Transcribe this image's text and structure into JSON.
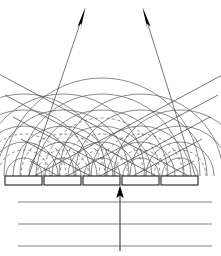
{
  "figure": {
    "title": "Phased array transducer beam steering with Huygens wavelets",
    "width": 221,
    "height": 256,
    "background_color": "#ffffff",
    "line_color": "#4a4a4a",
    "dark_line_color": "#1a1a1a",
    "arrow_color": "#000000"
  },
  "array": {
    "label": "transducer element array",
    "element_count": 5,
    "element_width": 37,
    "element_height": 9,
    "element_top_y": 176,
    "element_pitch": 39,
    "elements": [
      {
        "name": "element-1",
        "x": 5,
        "y": 176,
        "w": 37,
        "h": 9,
        "clipped": true
      },
      {
        "name": "element-2",
        "x": 44,
        "y": 176,
        "w": 37,
        "h": 9,
        "clipped": false
      },
      {
        "name": "element-3",
        "x": 83,
        "y": 176,
        "w": 37,
        "h": 9,
        "clipped": false
      },
      {
        "name": "element-4",
        "x": 122,
        "y": 176,
        "w": 37,
        "h": 9,
        "clipped": false
      },
      {
        "name": "element-5",
        "x": 161,
        "y": 176,
        "w": 37,
        "h": 9,
        "clipped": true
      }
    ]
  },
  "wavelets": {
    "label": "Huygens circular wavelets emitted by each element",
    "origins_x": [
      24,
      63,
      102,
      141,
      180
    ],
    "origin_y": 176,
    "solid_radii": [
      18,
      34,
      50,
      66,
      82,
      98,
      114
    ],
    "dashed_radii": [
      26,
      42,
      58
    ],
    "style_solid": "solid",
    "style_dashed": "dashed"
  },
  "beams": {
    "label": "two steered plane-wave beams",
    "count": 2,
    "left_beam": {
      "name": "beam-steered-right",
      "direction_deg": 28,
      "arrow_tip": {
        "x": 85,
        "y": 8
      },
      "arrow_tail": {
        "x": 28,
        "y": 176
      },
      "wavefront_count": 4,
      "wavefront_spacing": 22
    },
    "right_beam": {
      "name": "beam-steered-left",
      "direction_deg": -28,
      "arrow_tip": {
        "x": 143,
        "y": 8
      },
      "arrow_tail": {
        "x": 196,
        "y": 176
      },
      "wavefront_count": 4,
      "wavefront_spacing": 22
    }
  },
  "medium": {
    "label": "medium below array with horizontal reference lines",
    "line_count": 3,
    "lines_y": [
      202,
      224,
      246
    ],
    "line_x_start": 18,
    "line_x_end": 212
  },
  "excitation_arrow": {
    "label": "excitation / incident direction arrow",
    "x": 120,
    "tail_y": 250,
    "tip_y": 186,
    "direction": "up"
  },
  "icons": {
    "arrowhead": "arrowhead-icon",
    "up_arrow": "up-arrow-icon"
  }
}
